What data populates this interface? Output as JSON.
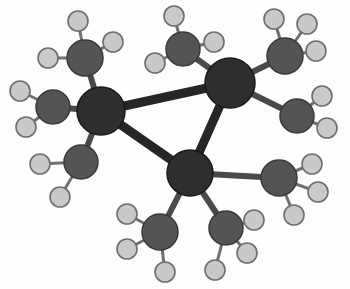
{
  "figure": {
    "canvas": {
      "width": 350,
      "height": 289
    },
    "background_color": "#fdfdfc"
  },
  "style": {
    "core_atom_color": "#2e2e2e",
    "core_atom_stroke": "#1a1a1a",
    "methyl_atom_color": "#545454",
    "methyl_atom_stroke": "#3a3a3a",
    "hydrogen_atom_color": "#c9c9c7",
    "hydrogen_atom_stroke": "#6e6e6e",
    "core_bond_color": "#262626",
    "methyl_bond_color": "#4a4a4a",
    "hydrogen_bond_color": "#707070",
    "core_atom_radius": 23,
    "methyl_atom_radius": 17,
    "hydrogen_atom_radius": 10,
    "core_bond_width": 9,
    "methyl_bond_width": 6,
    "hydrogen_bond_width": 3
  },
  "chart_data": {
    "type": "scatter",
    "xlabel": "",
    "ylabel": "",
    "xlim": [
      0,
      350
    ],
    "ylim": [
      0,
      289
    ],
    "grid": false,
    "legend": "none",
    "core_atoms": [
      {
        "id": "core-left",
        "label": "core-atom-left",
        "x": 101,
        "y": 111,
        "r": 24
      },
      {
        "id": "core-top",
        "label": "core-atom-top-right",
        "x": 230,
        "y": 83,
        "r": 25
      },
      {
        "id": "core-bottom",
        "label": "core-atom-bottom",
        "x": 190,
        "y": 173,
        "r": 23
      }
    ],
    "methyl_atoms": [
      {
        "id": "m1",
        "label": "methyl-top-left",
        "x": 85,
        "y": 58,
        "r": 18,
        "parent": "core-left"
      },
      {
        "id": "m2",
        "label": "methyl-left",
        "x": 53,
        "y": 107,
        "r": 17,
        "parent": "core-left"
      },
      {
        "id": "m3",
        "label": "methyl-lower-left",
        "x": 81,
        "y": 162,
        "r": 17,
        "parent": "core-left"
      },
      {
        "id": "m4",
        "label": "methyl-top-middle",
        "x": 183,
        "y": 49,
        "r": 17,
        "parent": "core-top"
      },
      {
        "id": "m5",
        "label": "methyl-top-right",
        "x": 285,
        "y": 56,
        "r": 18,
        "parent": "core-top"
      },
      {
        "id": "m6",
        "label": "methyl-right",
        "x": 297,
        "y": 116,
        "r": 17,
        "parent": "core-top"
      },
      {
        "id": "m7",
        "label": "methyl-lower-right",
        "x": 279,
        "y": 178,
        "r": 18,
        "parent": "core-bottom"
      },
      {
        "id": "m8",
        "label": "methyl-bottom-right",
        "x": 226,
        "y": 228,
        "r": 17,
        "parent": "core-bottom"
      },
      {
        "id": "m9",
        "label": "methyl-bottom-left",
        "x": 160,
        "y": 232,
        "r": 18,
        "parent": "core-bottom"
      }
    ],
    "hydrogen_atoms": [
      {
        "id": "h1",
        "x": 78,
        "y": 21,
        "r": 10,
        "parent": "m1"
      },
      {
        "id": "h2",
        "x": 113,
        "y": 42,
        "r": 10,
        "parent": "m1"
      },
      {
        "id": "h3",
        "x": 48,
        "y": 58,
        "r": 10,
        "parent": "m1"
      },
      {
        "id": "h4",
        "x": 20,
        "y": 91,
        "r": 10,
        "parent": "m2"
      },
      {
        "id": "h5",
        "x": 26,
        "y": 127,
        "r": 10,
        "parent": "m2"
      },
      {
        "id": "h6",
        "x": 40,
        "y": 164,
        "r": 10,
        "parent": "m3"
      },
      {
        "id": "h7",
        "x": 60,
        "y": 197,
        "r": 10,
        "parent": "m3"
      },
      {
        "id": "h8",
        "x": 174,
        "y": 16,
        "r": 10,
        "parent": "m4"
      },
      {
        "id": "h9",
        "x": 214,
        "y": 42,
        "r": 10,
        "parent": "m4"
      },
      {
        "id": "h10",
        "x": 155,
        "y": 63,
        "r": 10,
        "parent": "m4"
      },
      {
        "id": "h11",
        "x": 274,
        "y": 19,
        "r": 10,
        "parent": "m5"
      },
      {
        "id": "h12",
        "x": 307,
        "y": 24,
        "r": 10,
        "parent": "m5"
      },
      {
        "id": "h13",
        "x": 316,
        "y": 51,
        "r": 10,
        "parent": "m5"
      },
      {
        "id": "h14",
        "x": 322,
        "y": 96,
        "r": 10,
        "parent": "m6"
      },
      {
        "id": "h15",
        "x": 327,
        "y": 128,
        "r": 10,
        "parent": "m6"
      },
      {
        "id": "h16",
        "x": 312,
        "y": 164,
        "r": 10,
        "parent": "m7"
      },
      {
        "id": "h17",
        "x": 318,
        "y": 192,
        "r": 10,
        "parent": "m7"
      },
      {
        "id": "h18",
        "x": 294,
        "y": 215,
        "r": 10,
        "parent": "m7"
      },
      {
        "id": "h19",
        "x": 254,
        "y": 220,
        "r": 10,
        "parent": "m8"
      },
      {
        "id": "h20",
        "x": 247,
        "y": 253,
        "r": 10,
        "parent": "m8"
      },
      {
        "id": "h21",
        "x": 215,
        "y": 270,
        "r": 10,
        "parent": "m8"
      },
      {
        "id": "h22",
        "x": 127,
        "y": 214,
        "r": 10,
        "parent": "m9"
      },
      {
        "id": "h23",
        "x": 127,
        "y": 249,
        "r": 10,
        "parent": "m9"
      },
      {
        "id": "h24",
        "x": 165,
        "y": 272,
        "r": 10,
        "parent": "m9"
      }
    ],
    "core_bonds": [
      {
        "from": "core-left",
        "to": "core-top"
      },
      {
        "from": "core-left",
        "to": "core-bottom"
      },
      {
        "from": "core-top",
        "to": "core-bottom"
      }
    ]
  }
}
